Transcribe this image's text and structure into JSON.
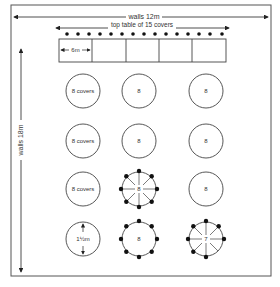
{
  "diagram": {
    "walls_width_label": "walls 12m",
    "walls_height_label": "walls 18m",
    "top_table": {
      "label": "top table of 15 covers",
      "section_label": "6m",
      "sections": 5,
      "covers": 15
    },
    "tables": [
      {
        "row": 1,
        "col": 1,
        "label": "8 covers",
        "style": "plain"
      },
      {
        "row": 1,
        "col": 2,
        "label": "8",
        "style": "plain"
      },
      {
        "row": 1,
        "col": 3,
        "label": "8",
        "style": "plain"
      },
      {
        "row": 2,
        "col": 1,
        "label": "8 covers",
        "style": "plain"
      },
      {
        "row": 2,
        "col": 2,
        "label": "8",
        "style": "plain"
      },
      {
        "row": 2,
        "col": 3,
        "label": "8",
        "style": "plain"
      },
      {
        "row": 3,
        "col": 1,
        "label": "8 covers",
        "style": "plain"
      },
      {
        "row": 3,
        "col": 2,
        "label": "8",
        "style": "spokes-8-seats"
      },
      {
        "row": 3,
        "col": 3,
        "label": "8",
        "style": "plain"
      },
      {
        "row": 4,
        "col": 1,
        "label": "1½m",
        "style": "diameter"
      },
      {
        "row": 4,
        "col": 2,
        "label": "8",
        "style": "8-seats"
      },
      {
        "row": 4,
        "col": 3,
        "label": "7",
        "style": "spokes-7-seats"
      }
    ],
    "colors": {
      "line": "#444444",
      "seat": "#111111",
      "background": "#ffffff"
    }
  }
}
